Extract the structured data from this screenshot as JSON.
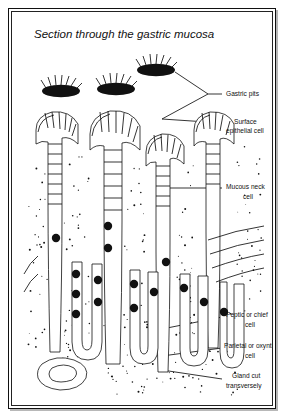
{
  "figure": {
    "title": "Section through the gastric mucosa",
    "kind": "histology-diagram",
    "border_color": "#111111",
    "ink_color": "#111111",
    "background_color": "#ffffff"
  },
  "labels": [
    {
      "id": "gastric-pits",
      "text": "Gastric pits",
      "text2": "",
      "x": 214,
      "y": 84
    },
    {
      "id": "surface-epithelial",
      "text": "Surface",
      "text2": "epithelial cell",
      "x": 214,
      "y": 114
    },
    {
      "id": "mucous-neck",
      "text": "Mucous neck",
      "text2": "cell",
      "x": 214,
      "y": 177
    },
    {
      "id": "peptic-chief",
      "text": "Peptic or chief",
      "text2": "cell",
      "x": 214,
      "y": 308
    },
    {
      "id": "parietal-oxyntic",
      "text": "Parietal or oxyntic",
      "text2": "cell",
      "x": 214,
      "y": 339
    },
    {
      "id": "gland-transverse",
      "text": "Gland cut",
      "text2": "transversely",
      "x": 214,
      "y": 369
    }
  ],
  "structures": [
    {
      "id": "gastric-pit-1",
      "name": "gastric pit opening"
    },
    {
      "id": "gastric-pit-2",
      "name": "gastric pit opening"
    },
    {
      "id": "gastric-pit-3",
      "name": "gastric pit opening"
    },
    {
      "id": "gastric-gland-1",
      "name": "gastric gland tubule"
    },
    {
      "id": "gastric-gland-2",
      "name": "gastric gland tubule"
    },
    {
      "id": "gastric-gland-3",
      "name": "gastric gland tubule"
    },
    {
      "id": "gland-cross-section",
      "name": "gland cut transversely"
    }
  ]
}
